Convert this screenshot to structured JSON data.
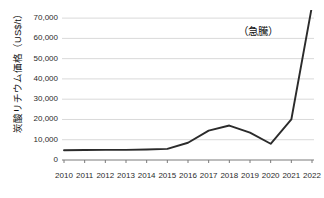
{
  "chart_data": {
    "type": "line",
    "title": "",
    "xlabel": "",
    "ylabel": "炭酸リチウム価格（US$/t）",
    "categories": [
      "2010",
      "2011",
      "2012",
      "2013",
      "2014",
      "2015",
      "2016",
      "2017",
      "2018",
      "2019",
      "2020",
      "2021",
      "2022"
    ],
    "values": [
      4800,
      4900,
      5000,
      5000,
      5200,
      5500,
      8500,
      14500,
      17000,
      13500,
      8000,
      20000,
      76000
    ],
    "series": [
      {
        "name": "炭酸リチウム価格",
        "values": [
          4800,
          4900,
          5000,
          5000,
          5200,
          5500,
          8500,
          14500,
          17000,
          13500,
          8000,
          20000,
          76000
        ]
      }
    ],
    "ylim": [
      0,
      74000
    ],
    "xlim": [
      "2010",
      "2022"
    ],
    "yticks": [
      0,
      10000,
      20000,
      30000,
      40000,
      50000,
      60000,
      70000
    ],
    "ytick_labels": [
      "0",
      "10,000",
      "20,000",
      "30,000",
      "40,000",
      "50,000",
      "60,000",
      "70,000"
    ],
    "xtick_labels": [
      "2010",
      "2011",
      "2012",
      "2013",
      "2014",
      "2015",
      "2016",
      "2017",
      "2018",
      "2019",
      "2020",
      "2021",
      "2022"
    ],
    "grid": "horizontal",
    "legend": "none",
    "line_color": "#2b2b2b",
    "grid_color": "#d9d9d9",
    "axis_color": "#7a7a7a",
    "annotations": [
      {
        "text": "（急騰）",
        "x": "2021",
        "y": 63000
      }
    ]
  }
}
